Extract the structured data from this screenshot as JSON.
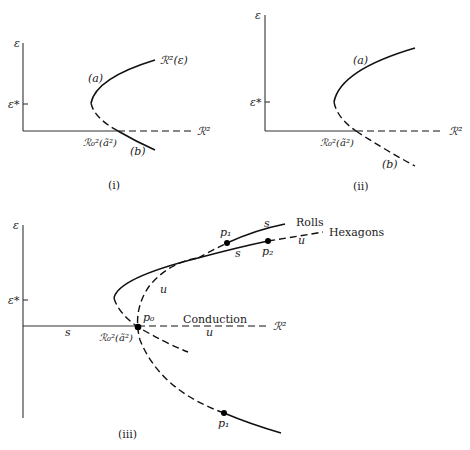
{
  "panels": [
    {
      "id": "i",
      "caption": "(i)",
      "y_axis_label": "ε",
      "eps_star_label": "ε*",
      "x_axis_label": "ℛ²",
      "critical_label": "ℛ₀²(ã²)",
      "curve_label": "ℛ²(ε)",
      "branch_a_label": "(a)",
      "branch_b_label": "(b)",
      "description": "Branch (a) solid above ε*, dashed below; branch (b) solid below R-axis"
    },
    {
      "id": "ii",
      "caption": "(ii)",
      "y_axis_label": "ε",
      "eps_star_label": "ε*",
      "x_axis_label": "ℛ²",
      "critical_label": "ℛ₀²(ã²)",
      "branch_a_label": "(a)",
      "branch_b_label": "(b)",
      "description": "Branch (a) solid above ε*, dashed below through ℛ₀² and continuing dashed as (b)"
    },
    {
      "id": "iii",
      "caption": "(iii)",
      "y_axis_label": "ε",
      "eps_star_label": "ε*",
      "x_axis_label": "ℛ²",
      "critical_label": "ℛ₀²(ã²)",
      "conduction_label": "Conduction",
      "rolls_label": "Rolls",
      "hexagons_label": "Hexagons",
      "stable_label": "s",
      "unstable_label": "u",
      "points": {
        "p0": "p₀",
        "p1": "p₁",
        "p2": "p₂"
      }
    }
  ]
}
